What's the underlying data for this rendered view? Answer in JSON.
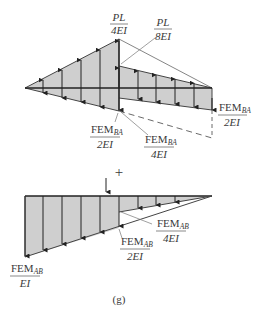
{
  "figure": {
    "caption": "(g)",
    "plus_sign": "+",
    "colors": {
      "fill": "#cfcfcf",
      "stroke": "#333333",
      "thin": "#666666",
      "text": "#3a3a3a"
    },
    "upper": {
      "labels": [
        {
          "id": "pl4",
          "num": "PL",
          "den": "4EI"
        },
        {
          "id": "pl8",
          "num": "PL",
          "den": "8EI"
        },
        {
          "id": "fem_ba_2ei_right",
          "num_main": "FEM",
          "num_sub": "BA",
          "den": "2EI"
        },
        {
          "id": "fem_ba_2ei_left",
          "num_main": "FEM",
          "num_sub": "BA",
          "den": "2EI"
        },
        {
          "id": "fem_ba_4ei",
          "num_main": "FEM",
          "num_sub": "BA",
          "den": "4EI"
        }
      ]
    },
    "lower": {
      "labels": [
        {
          "id": "fem_ab_4ei",
          "num_main": "FEM",
          "num_sub": "AB",
          "den": "4EI"
        },
        {
          "id": "fem_ab_2ei",
          "num_main": "FEM",
          "num_sub": "AB",
          "den": "2EI"
        },
        {
          "id": "fem_ab_ei",
          "num_main": "FEM",
          "num_sub": "AB",
          "den": "EI"
        }
      ]
    }
  }
}
